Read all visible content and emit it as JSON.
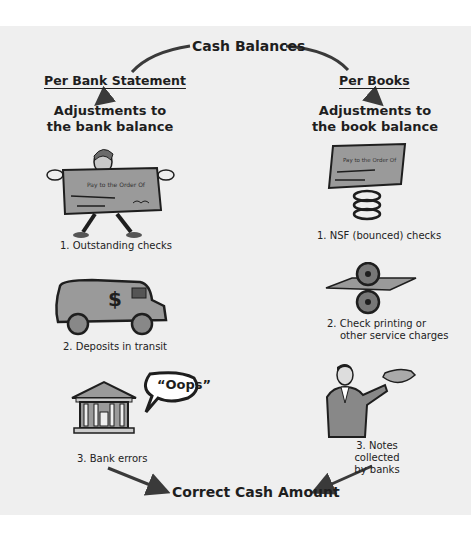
{
  "diagram": {
    "title": "Cash Balances",
    "bottom": "Correct Cash Amount",
    "left": {
      "header": "Per Bank Statement",
      "subheader_line1": "Adjustments to",
      "subheader_line2": "the bank balance",
      "items": [
        {
          "label": "1.  Outstanding checks",
          "icon": "person-holding-check-icon"
        },
        {
          "label": "2.  Deposits in transit",
          "icon": "armored-truck-icon"
        },
        {
          "label": "3.  Bank errors",
          "icon": "bank-building-icon",
          "bubble": "“Oops”"
        }
      ]
    },
    "right": {
      "header": "Per Books",
      "subheader_line1": "Adjustments to",
      "subheader_line2": "the book balance",
      "items": [
        {
          "label": "1.  NSF (bounced) checks",
          "icon": "check-on-spring-icon"
        },
        {
          "label_line1": "2.  Check printing or",
          "label_line2": "other service charges",
          "icon": "printing-rollers-icon"
        },
        {
          "label_line1": "3.  Notes collected",
          "label_line2": "by banks",
          "icon": "businessman-holding-money-icon"
        }
      ]
    },
    "check_text": "Pay to the Order Of",
    "colors": {
      "background": "#efefef",
      "ink": "#1e1e1e",
      "fill_gray": "#9a9a9a",
      "arrow": "#3a3a3a"
    }
  }
}
